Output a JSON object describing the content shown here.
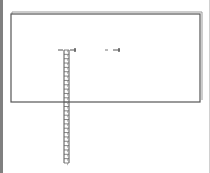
{
  "diagram": {
    "title": "",
    "elements": {
      "panel": {
        "label": "panel"
      },
      "ruler": {
        "label": "ruler",
        "ticks": 26
      },
      "marker_left": {
        "label": "marker"
      },
      "marker_right": {
        "label": "marker"
      }
    },
    "colors": {
      "stroke": "#555555",
      "shadow": "#999999",
      "border": "#808080"
    }
  }
}
